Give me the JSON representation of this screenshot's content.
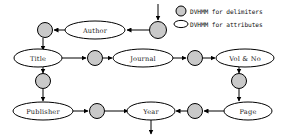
{
  "diagram": {
    "colors": {
      "delimiter_fill": "#c9c9c9",
      "attribute_fill": "#ffffff",
      "stroke": "#000000",
      "background": "#ffffff"
    },
    "attribute_nodes": [
      {
        "id": "author",
        "label": "Author",
        "cx": 95,
        "cy": 30,
        "rx": 30,
        "ry": 9
      },
      {
        "id": "title",
        "label": "Title",
        "cx": 38,
        "cy": 58,
        "rx": 24,
        "ry": 9
      },
      {
        "id": "journal",
        "label": "Journal",
        "cx": 143,
        "cy": 58,
        "rx": 30,
        "ry": 9
      },
      {
        "id": "vol_no",
        "label": "Vol & No",
        "cx": 245,
        "cy": 58,
        "rx": 29,
        "ry": 9
      },
      {
        "id": "publisher",
        "label": "Publisher",
        "cx": 43,
        "cy": 111,
        "rx": 30,
        "ry": 9
      },
      {
        "id": "year",
        "label": "Year",
        "cx": 151,
        "cy": 111,
        "rx": 24,
        "ry": 9
      },
      {
        "id": "page",
        "label": "Page",
        "cx": 248,
        "cy": 111,
        "rx": 24,
        "ry": 9
      }
    ],
    "delimiter_nodes": [
      {
        "id": "d-entry",
        "cx": 158,
        "cy": 30,
        "r": 8.5
      },
      {
        "id": "d-author-left",
        "cx": 45,
        "cy": 30,
        "r": 7.5
      },
      {
        "id": "d-title-journal",
        "cx": 95,
        "cy": 58,
        "r": 7.5
      },
      {
        "id": "d-journal-vol",
        "cx": 195,
        "cy": 58,
        "r": 7.5
      },
      {
        "id": "d-title-pub",
        "cx": 43,
        "cy": 81,
        "r": 7.5
      },
      {
        "id": "d-vol-page",
        "cx": 239,
        "cy": 81,
        "r": 7.5
      },
      {
        "id": "d-pub-year",
        "cx": 97,
        "cy": 111,
        "r": 7.5
      },
      {
        "id": "d-page-year",
        "cx": 195,
        "cy": 111,
        "r": 7.5
      }
    ],
    "legend": {
      "items": [
        {
          "id": "legend-delimiters",
          "shape": "circle",
          "label": "DVHMM for delimiters"
        },
        {
          "id": "legend-attributes",
          "shape": "ellipse",
          "label": "DVHMM for attributes"
        }
      ]
    },
    "flow": {
      "entry_arrow": "top arrow into entry delimiter",
      "exit_arrow": "bottom arrow out of Year"
    }
  }
}
